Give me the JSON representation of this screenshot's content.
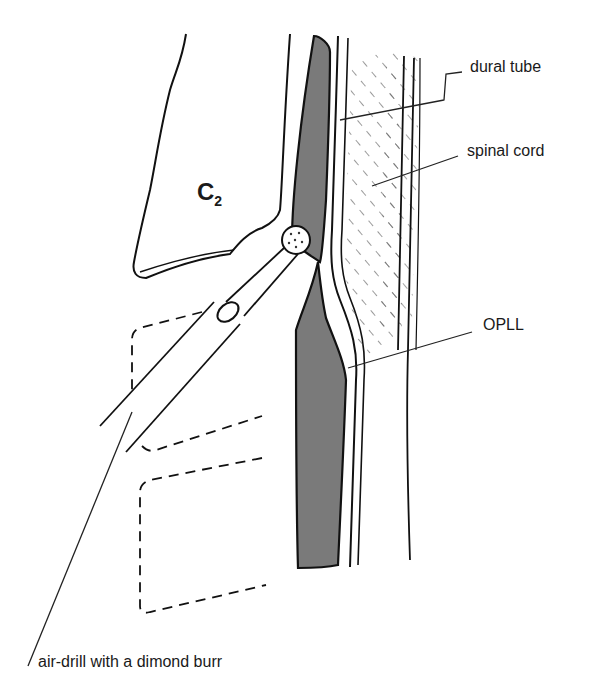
{
  "diagram": {
    "type": "anatomical-illustration",
    "vertebra_label": {
      "main": "C",
      "sub": "2"
    },
    "labels": {
      "dural_tube": "dural tube",
      "spinal_cord": "spinal cord",
      "opll": "OPLL",
      "drill": "air-drill with a dimond burr"
    },
    "colors": {
      "line": "#111111",
      "opll_fill": "#7a7a7a",
      "hatch": "#555555",
      "background": "#ffffff"
    }
  }
}
